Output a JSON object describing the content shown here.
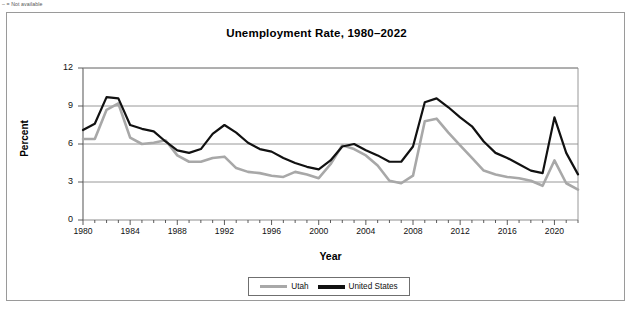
{
  "footnote": "– = Not available",
  "chart_data": {
    "type": "line",
    "title": "Unemployment Rate, 1980–2022",
    "xlabel": "Year",
    "ylabel": "Percent",
    "xlim": [
      1980,
      2022
    ],
    "ylim": [
      0,
      12
    ],
    "ytick_values": [
      0,
      3,
      6,
      9,
      12
    ],
    "xtick_labels": [
      "1980",
      "1984",
      "1988",
      "1992",
      "1996",
      "2000",
      "2004",
      "2008",
      "2012",
      "2016",
      "2020"
    ],
    "xtick_values": [
      1980,
      1984,
      1988,
      1992,
      1996,
      2000,
      2004,
      2008,
      2012,
      2016,
      2020
    ],
    "minor_xticks_every": 1,
    "grid": "horizontal",
    "legend_position": "bottom",
    "x": [
      1980,
      1981,
      1982,
      1983,
      1984,
      1985,
      1986,
      1987,
      1988,
      1989,
      1990,
      1991,
      1992,
      1993,
      1994,
      1995,
      1996,
      1997,
      1998,
      1999,
      2000,
      2001,
      2002,
      2003,
      2004,
      2005,
      2006,
      2007,
      2008,
      2009,
      2010,
      2011,
      2012,
      2013,
      2014,
      2015,
      2016,
      2017,
      2018,
      2019,
      2020,
      2021,
      2022
    ],
    "series": [
      {
        "name": "Utah",
        "color": "#a8a8a8",
        "values": [
          6.4,
          6.4,
          8.7,
          9.2,
          6.5,
          6.0,
          6.1,
          6.3,
          5.1,
          4.6,
          4.6,
          4.9,
          5.0,
          4.1,
          3.8,
          3.7,
          3.5,
          3.4,
          3.8,
          3.6,
          3.3,
          4.4,
          5.9,
          5.6,
          5.1,
          4.3,
          3.1,
          2.9,
          3.5,
          7.8,
          8.0,
          6.9,
          5.9,
          4.9,
          3.9,
          3.6,
          3.4,
          3.3,
          3.1,
          2.7,
          4.7,
          2.9,
          2.4
        ]
      },
      {
        "name": "United States",
        "color": "#111111",
        "values": [
          7.1,
          7.6,
          9.7,
          9.6,
          7.5,
          7.2,
          7.0,
          6.2,
          5.5,
          5.3,
          5.6,
          6.8,
          7.5,
          6.9,
          6.1,
          5.6,
          5.4,
          4.9,
          4.5,
          4.2,
          4.0,
          4.7,
          5.8,
          6.0,
          5.5,
          5.1,
          4.6,
          4.6,
          5.8,
          9.3,
          9.6,
          8.9,
          8.1,
          7.4,
          6.2,
          5.3,
          4.9,
          4.4,
          3.9,
          3.7,
          8.1,
          5.3,
          3.6
        ]
      }
    ]
  },
  "legend": {
    "items": [
      {
        "label": "Utah"
      },
      {
        "label": "United States"
      }
    ]
  }
}
